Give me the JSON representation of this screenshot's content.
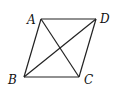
{
  "diagram": {
    "type": "quadrilateral-with-diagonals",
    "vertices": [
      {
        "name": "A",
        "x": 41,
        "y": 19,
        "label_x": 27,
        "label_y": 24
      },
      {
        "name": "D",
        "x": 96,
        "y": 19,
        "label_x": 100,
        "label_y": 23
      },
      {
        "name": "B",
        "x": 24,
        "y": 77,
        "label_x": 8,
        "label_y": 84
      },
      {
        "name": "C",
        "x": 79,
        "y": 77,
        "label_x": 84,
        "label_y": 84
      }
    ],
    "edges": [
      [
        "A",
        "D"
      ],
      [
        "D",
        "C"
      ],
      [
        "C",
        "B"
      ],
      [
        "B",
        "A"
      ]
    ],
    "diagonals": [
      [
        "A",
        "C"
      ],
      [
        "B",
        "D"
      ]
    ],
    "line_color": "#222222"
  }
}
